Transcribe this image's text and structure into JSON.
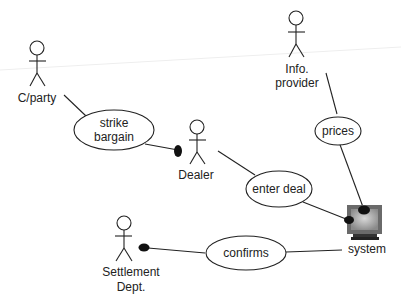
{
  "diagram": {
    "type": "UML use case diagram",
    "actors": [
      {
        "id": "cparty",
        "label_lines": [
          "C/party"
        ]
      },
      {
        "id": "dealer",
        "label_lines": [
          "Dealer"
        ]
      },
      {
        "id": "info_provider",
        "label_lines": [
          "Info.",
          "provider"
        ]
      },
      {
        "id": "settlement",
        "label_lines": [
          "Settlement",
          "Dept."
        ]
      },
      {
        "id": "system",
        "label_lines": [
          "system"
        ],
        "icon": "computer-monitor-icon"
      }
    ],
    "use_cases": [
      {
        "id": "strike_bargain",
        "label_lines": [
          "strike",
          "bargain"
        ]
      },
      {
        "id": "prices",
        "label_lines": [
          "prices"
        ]
      },
      {
        "id": "enter_deal",
        "label_lines": [
          "enter deal"
        ]
      },
      {
        "id": "confirms",
        "label_lines": [
          "confirms"
        ]
      }
    ],
    "associations": [
      {
        "from": "cparty",
        "to": "strike_bargain"
      },
      {
        "from": "strike_bargain",
        "to": "dealer",
        "navigable_end": "dealer"
      },
      {
        "from": "dealer",
        "to": "enter_deal"
      },
      {
        "from": "enter_deal",
        "to": "system",
        "navigable_end": "system"
      },
      {
        "from": "info_provider",
        "to": "prices"
      },
      {
        "from": "prices",
        "to": "system",
        "navigable_end": "system"
      },
      {
        "from": "system",
        "to": "confirms"
      },
      {
        "from": "confirms",
        "to": "settlement",
        "navigable_end": "settlement"
      }
    ]
  }
}
